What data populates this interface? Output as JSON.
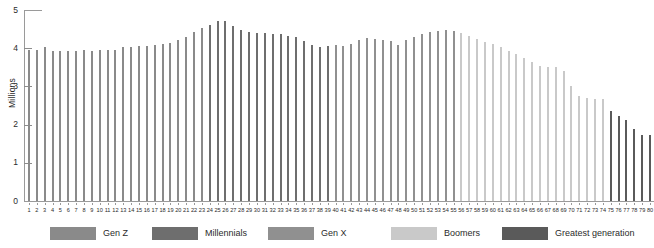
{
  "chart_data": {
    "type": "bar",
    "title": "",
    "subtitle": "",
    "xlabel": "",
    "ylabel": "Millions",
    "ylim": [
      0,
      5
    ],
    "xlim": [
      1,
      80
    ],
    "grid": false,
    "legend_position": "bottom",
    "y_ticks": [
      "0",
      "1",
      "2",
      "3",
      "4",
      "5"
    ],
    "y_tick_values": [
      0,
      1,
      2,
      3,
      4,
      5
    ],
    "categories": [
      "1",
      "2",
      "3",
      "4",
      "5",
      "6",
      "7",
      "8",
      "9",
      "10",
      "11",
      "12",
      "13",
      "14",
      "15",
      "16",
      "17",
      "18",
      "19",
      "20",
      "21",
      "22",
      "23",
      "24",
      "25",
      "26",
      "27",
      "28",
      "29",
      "30",
      "31",
      "32",
      "33",
      "34",
      "35",
      "36",
      "37",
      "38",
      "39",
      "40",
      "41",
      "42",
      "43",
      "44",
      "45",
      "46",
      "47",
      "48",
      "49",
      "50",
      "51",
      "52",
      "53",
      "54",
      "55",
      "56",
      "57",
      "58",
      "59",
      "60",
      "61",
      "62",
      "63",
      "64",
      "65",
      "66",
      "67",
      "68",
      "69",
      "70",
      "71",
      "72",
      "73",
      "74",
      "75",
      "76",
      "77",
      "78",
      "79",
      "80"
    ],
    "values": [
      3.95,
      3.96,
      4.02,
      3.92,
      3.93,
      3.93,
      3.94,
      3.95,
      3.94,
      3.96,
      3.95,
      3.96,
      4.02,
      4.04,
      4.05,
      4.06,
      4.08,
      4.1,
      4.14,
      4.22,
      4.3,
      4.42,
      4.52,
      4.6,
      4.7,
      4.72,
      4.58,
      4.47,
      4.42,
      4.41,
      4.4,
      4.38,
      4.36,
      4.33,
      4.29,
      4.18,
      4.09,
      4.03,
      4.05,
      4.08,
      4.06,
      4.11,
      4.22,
      4.26,
      4.24,
      4.22,
      4.2,
      4.08,
      4.22,
      4.3,
      4.37,
      4.42,
      4.45,
      4.47,
      4.46,
      4.4,
      4.33,
      4.24,
      4.16,
      4.12,
      4.02,
      3.94,
      3.85,
      3.74,
      3.64,
      3.53,
      3.5,
      3.5,
      3.41,
      3.0,
      2.74,
      2.7,
      2.68,
      2.66,
      2.36,
      2.23,
      2.12,
      1.88,
      1.73,
      1.72
    ],
    "series": [
      {
        "name": "Gen Z",
        "age_range": [
          1,
          23
        ],
        "color": "#8a8a8a"
      },
      {
        "name": "Millennials",
        "age_range": [
          24,
          39
        ],
        "color": "#6e6e6e"
      },
      {
        "name": "Gen X",
        "age_range": [
          40,
          55
        ],
        "color": "#909090"
      },
      {
        "name": "Boomers",
        "age_range": [
          56,
          74
        ],
        "color": "#c9c9c9"
      },
      {
        "name": "Greatest generation",
        "age_range": [
          75,
          80
        ],
        "color": "#5a5a5a"
      }
    ]
  },
  "legend": {
    "items": [
      {
        "label": "Gen Z",
        "color": "#8a8a8a"
      },
      {
        "label": "Millennials",
        "color": "#6e6e6e"
      },
      {
        "label": "Gen X",
        "color": "#909090"
      },
      {
        "label": "Boomers",
        "color": "#c9c9c9"
      },
      {
        "label": "Greatest generation",
        "color": "#5a5a5a"
      }
    ]
  },
  "axis": {
    "y_title": "Millions"
  },
  "style": {
    "axis_color": "#9a9a9a",
    "text_color": "#2b2b2b",
    "background": "#ffffff"
  }
}
